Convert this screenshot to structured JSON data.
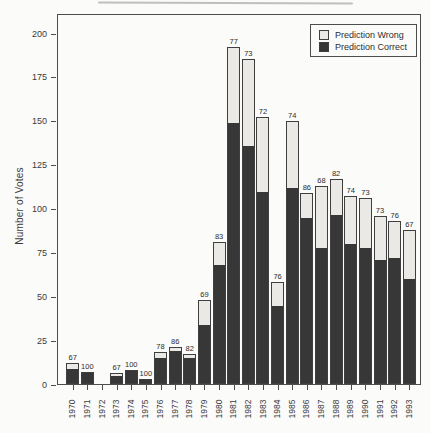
{
  "figure": {
    "ylabel": "Number of Votes",
    "legend": {
      "items": [
        {
          "label": "Prediction Wrong",
          "color": "#eae9e6"
        },
        {
          "label": "Prediction Correct",
          "color": "#373737"
        }
      ]
    }
  },
  "chart_data": {
    "type": "bar",
    "stacked": true,
    "title": "",
    "xlabel": "",
    "ylabel": "Number of Votes",
    "ylim": [
      0,
      200
    ],
    "yticks": [
      0,
      25,
      50,
      75,
      100,
      125,
      150,
      175,
      200
    ],
    "grid": false,
    "legend_position": "top-right",
    "categories": [
      "1970",
      "1971",
      "1972",
      "1973",
      "1974",
      "1975",
      "1976",
      "1977",
      "1978",
      "1979",
      "1980",
      "1981",
      "1982",
      "1983",
      "1984",
      "1985",
      "1986",
      "1987",
      "1988",
      "1989",
      "1990",
      "1991",
      "1992",
      "1993"
    ],
    "series": [
      {
        "name": "Prediction Wrong",
        "color": "#eae9e6",
        "values": [
          4,
          0,
          0,
          2,
          0,
          0,
          4,
          3,
          3,
          15,
          14,
          44,
          50,
          43,
          14,
          39,
          15,
          36,
          21,
          28,
          29,
          26,
          22,
          29
        ]
      },
      {
        "name": "Prediction Correct",
        "color": "#373737",
        "values": [
          8,
          7,
          0,
          4,
          8,
          3,
          14,
          18,
          14,
          33,
          67,
          148,
          135,
          109,
          44,
          111,
          94,
          77,
          96,
          79,
          77,
          70,
          71,
          59
        ]
      }
    ],
    "totals": [
      12,
      7,
      0,
      6,
      8,
      3,
      18,
      21,
      17,
      48,
      81,
      192,
      185,
      152,
      58,
      150,
      109,
      113,
      117,
      107,
      106,
      96,
      93,
      88
    ],
    "bar_labels": [
      "67",
      "100",
      "",
      "67",
      "100",
      "100",
      "78",
      "86",
      "82",
      "69",
      "83",
      "77",
      "73",
      "72",
      "76",
      "74",
      "86",
      "68",
      "82",
      "74",
      "73",
      "73",
      "76",
      "67"
    ]
  },
  "colors": {
    "frame": "#4d4d4d",
    "text": "#3a3a3a",
    "correct_fill": "#373737",
    "wrong_fill": "#eae9e6",
    "background": "#fbfbfa"
  }
}
